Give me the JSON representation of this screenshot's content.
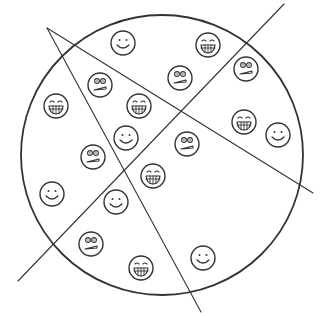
{
  "diagram": {
    "title": "Circle divided by three lines containing emoji faces",
    "circle": {
      "cx": 162,
      "cy": 155,
      "rx": 141,
      "ry": 140,
      "stroke": "#333333"
    },
    "lines": [
      {
        "name": "line-a",
        "x1": 47,
        "y1": 28,
        "x2": 313,
        "y2": 193
      },
      {
        "name": "line-b",
        "x1": 47,
        "y1": 28,
        "x2": 201,
        "y2": 312
      },
      {
        "name": "line-c",
        "x1": 284,
        "y1": 4,
        "x2": 18,
        "y2": 281
      }
    ],
    "face_radius": 12,
    "faces": [
      {
        "type": "smile",
        "x": 123,
        "y": 43
      },
      {
        "type": "grin",
        "x": 208,
        "y": 45
      },
      {
        "type": "worried",
        "x": 100,
        "y": 85
      },
      {
        "type": "worried",
        "x": 180,
        "y": 78
      },
      {
        "type": "worried",
        "x": 246,
        "y": 69
      },
      {
        "type": "grin",
        "x": 56,
        "y": 106
      },
      {
        "type": "grin",
        "x": 139,
        "y": 106
      },
      {
        "type": "grin",
        "x": 244,
        "y": 122
      },
      {
        "type": "smile",
        "x": 278,
        "y": 135
      },
      {
        "type": "smile",
        "x": 126,
        "y": 138
      },
      {
        "type": "worried",
        "x": 93,
        "y": 157
      },
      {
        "type": "worried",
        "x": 187,
        "y": 144
      },
      {
        "type": "grin",
        "x": 153,
        "y": 176
      },
      {
        "type": "smile",
        "x": 52,
        "y": 194
      },
      {
        "type": "smile",
        "x": 116,
        "y": 202
      },
      {
        "type": "worried",
        "x": 91,
        "y": 244
      },
      {
        "type": "smile",
        "x": 203,
        "y": 258
      },
      {
        "type": "grin",
        "x": 141,
        "y": 268
      }
    ],
    "counts": {
      "smile": 6,
      "grin": 6,
      "worried": 6,
      "total": 18
    }
  }
}
